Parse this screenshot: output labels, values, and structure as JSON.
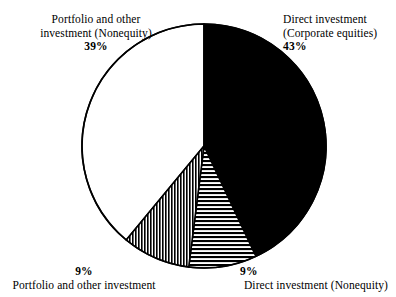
{
  "chart_data": {
    "type": "pie",
    "title": "",
    "subtitle": "",
    "xlabel": "",
    "ylabel": "",
    "legend_position": "none",
    "grid": false,
    "units": "percent",
    "start_angle_deg": 0,
    "direction": "clockwise",
    "categories": [
      "Direct investment (Corporate equities)",
      "Direct investment (Nonequity)",
      "Portfolio and other investment",
      "Portfolio and other investment (Nonequity)"
    ],
    "values": [
      43,
      9,
      9,
      39
    ],
    "slices": [
      {
        "label": "Direct investment (Corporate equities)",
        "value": 43,
        "value_text": "43%",
        "fill": "solid-black",
        "color": "#000000",
        "start_deg": 0,
        "end_deg": 154.8
      },
      {
        "label": "Direct investment (Nonequity)",
        "value": 9,
        "value_text": "9%",
        "fill": "horizontal-hatch",
        "color": "#000000",
        "start_deg": 154.8,
        "end_deg": 187.2
      },
      {
        "label": "Portfolio and other investment",
        "value": 9,
        "value_text": "9%",
        "fill": "vertical-hatch",
        "color": "#000000",
        "start_deg": 187.2,
        "end_deg": 219.6
      },
      {
        "label": "Portfolio and other investment (Nonequity)",
        "value": 39,
        "value_text": "39%",
        "fill": "white",
        "color": "#ffffff",
        "start_deg": 219.6,
        "end_deg": 360
      }
    ]
  },
  "labels": {
    "portfolio_nonequity": {
      "line1": "Portfolio and other",
      "line2": "investment (Nonequity)",
      "percent": "39%"
    },
    "direct_corporate": {
      "line1": "Direct investment",
      "line2": "(Corporate equities)",
      "percent": "43%"
    },
    "portfolio_other": {
      "percent": "9%",
      "line1": "Portfolio and other investment"
    },
    "direct_nonequity": {
      "percent": "9%",
      "line1": "Direct investment (Nonequity)"
    }
  },
  "style": {
    "background": "#ffffff",
    "stroke": "#000000",
    "solid_fill": "#000000",
    "empty_fill": "#ffffff"
  }
}
